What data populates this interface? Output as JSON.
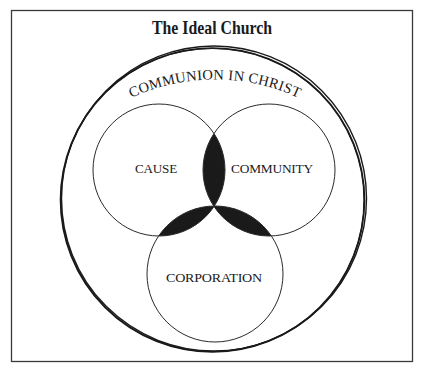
{
  "diagram": {
    "title": "The Ideal Church",
    "outer_circle_label": "COMMUNION IN CHRIST",
    "circles": [
      {
        "id": "cause",
        "label": "CAUSE"
      },
      {
        "id": "community",
        "label": "COMMUNITY"
      },
      {
        "id": "corporation",
        "label": "CORPORATION"
      }
    ],
    "colors": {
      "ink": "#1a1a1a",
      "background": "#ffffff",
      "frame": "#3a3a3a",
      "overlap_fill": "#1a1a1a"
    }
  }
}
